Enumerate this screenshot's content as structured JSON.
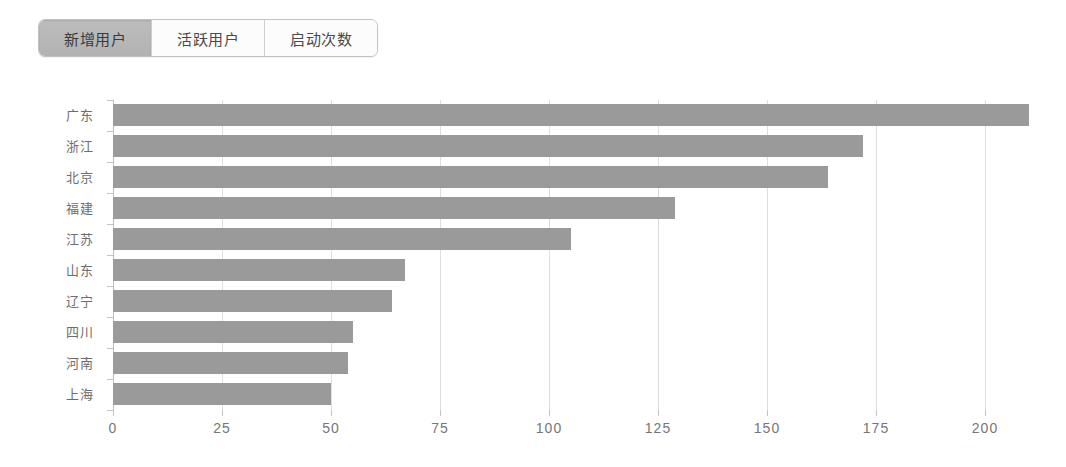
{
  "tabs": [
    {
      "label": "新增用户",
      "active": true
    },
    {
      "label": "活跃用户",
      "active": false
    },
    {
      "label": "启动次数",
      "active": false
    }
  ],
  "colors": {
    "bar": "#9a9a9a",
    "grid": "#dedede",
    "axis": "#bfbfbf",
    "tab_active_bg": "#b9b9b9",
    "tab_text": "#4a4a4a",
    "tick_text": "#767676",
    "category_text": "#6d6d6d"
  },
  "chart_data": {
    "type": "bar",
    "orientation": "horizontal",
    "title": "",
    "subtitle": "",
    "xlabel": "",
    "ylabel": "",
    "categories": [
      "广东",
      "浙江",
      "北京",
      "福建",
      "江苏",
      "山东",
      "辽宁",
      "四川",
      "河南",
      "上海"
    ],
    "values": [
      210,
      172,
      164,
      129,
      105,
      67,
      64,
      55,
      54,
      50
    ],
    "series": [
      {
        "name": "新增用户",
        "values": [
          210,
          172,
          164,
          129,
          105,
          67,
          64,
          55,
          54,
          50
        ]
      }
    ],
    "xlim": [
      0,
      200
    ],
    "xticks": [
      0,
      25,
      50,
      75,
      100,
      125,
      150,
      175,
      200
    ],
    "xticklabels": [
      "0",
      "25",
      "50",
      "75",
      "100",
      "125",
      "150",
      "175",
      "200"
    ],
    "grid": true,
    "grid_axis": "x",
    "legend": false,
    "legend_position": "none"
  }
}
